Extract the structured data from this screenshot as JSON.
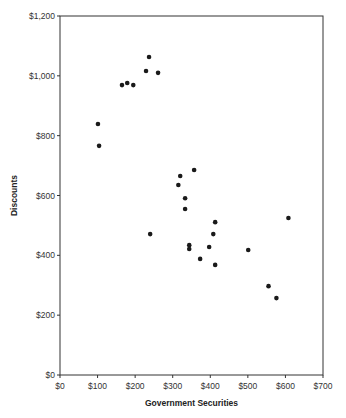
{
  "chart_data": {
    "type": "scatter",
    "title": "",
    "xlabel": "Government Securities",
    "ylabel": "Discounts",
    "xlim": [
      0,
      700
    ],
    "ylim": [
      0,
      1200
    ],
    "x_ticks": [
      0,
      100,
      200,
      300,
      400,
      500,
      600,
      700
    ],
    "x_tick_labels": [
      "$0",
      "$100",
      "$200",
      "$300",
      "$400",
      "$500",
      "$600",
      "$700"
    ],
    "y_ticks": [
      0,
      200,
      400,
      600,
      800,
      1000,
      1200
    ],
    "y_tick_labels": [
      "$0",
      "$200",
      "$400",
      "$600",
      "$800",
      "$1,000",
      "$1,200"
    ],
    "grid": false,
    "legend": null,
    "marker_color": "#1a1a1a",
    "series": [
      {
        "name": "Discounts vs Government Securities",
        "points": [
          {
            "x": 101,
            "y": 839
          },
          {
            "x": 104,
            "y": 766
          },
          {
            "x": 165,
            "y": 969
          },
          {
            "x": 179,
            "y": 976
          },
          {
            "x": 195,
            "y": 969
          },
          {
            "x": 229,
            "y": 1016
          },
          {
            "x": 237,
            "y": 1063
          },
          {
            "x": 261,
            "y": 1010
          },
          {
            "x": 240,
            "y": 471
          },
          {
            "x": 315,
            "y": 635
          },
          {
            "x": 320,
            "y": 665
          },
          {
            "x": 333,
            "y": 591
          },
          {
            "x": 333,
            "y": 555
          },
          {
            "x": 357,
            "y": 685
          },
          {
            "x": 344,
            "y": 434
          },
          {
            "x": 344,
            "y": 421
          },
          {
            "x": 373,
            "y": 388
          },
          {
            "x": 397,
            "y": 428
          },
          {
            "x": 408,
            "y": 471
          },
          {
            "x": 413,
            "y": 511
          },
          {
            "x": 413,
            "y": 368
          },
          {
            "x": 501,
            "y": 418
          },
          {
            "x": 555,
            "y": 297
          },
          {
            "x": 576,
            "y": 257
          },
          {
            "x": 608,
            "y": 525
          }
        ]
      }
    ]
  }
}
